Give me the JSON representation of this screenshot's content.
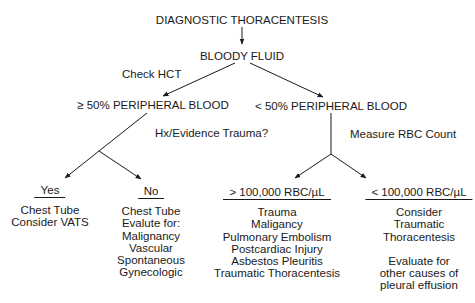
{
  "diagram": {
    "root": "DIAGNOSTIC THORACENTESIS",
    "level1": "BLOODY FLUID",
    "edge_label_hct": "Check HCT",
    "left_branch": {
      "label": "≥ 50% PERIPHERAL BLOOD",
      "question": "Hx/Evidence Trauma?",
      "yes": {
        "heading": "Yes",
        "lines": [
          "Chest Tube",
          "Consider VATS"
        ]
      },
      "no": {
        "heading": "No",
        "lines": [
          "Chest Tube",
          "Evalute for:",
          "Malignancy",
          "Vascular",
          "Spontaneous",
          "Gynecologic"
        ]
      }
    },
    "right_branch": {
      "label": "< 50% PERIPHERAL BLOOD",
      "question": "Measure RBC Count",
      "high": {
        "heading": "> 100,000 RBC/µL",
        "lines": [
          "Trauma",
          "Maligancy",
          "Pulmonary Embolism",
          "Postcardiac Injury",
          "Asbestos Pleuritis",
          "Traumatic Thoracentesis"
        ]
      },
      "low": {
        "heading": "< 100,000 RBC/µL",
        "lines": [
          "Consider",
          "Traumatic",
          "Thoracentesis",
          "",
          "Evaluate for",
          "other causes of",
          "pleural effusion"
        ]
      }
    }
  }
}
